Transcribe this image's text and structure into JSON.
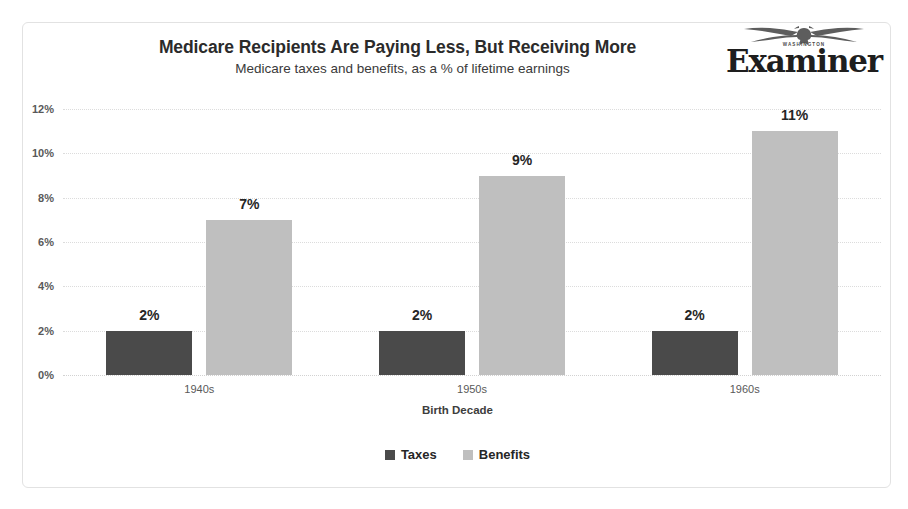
{
  "frame": {
    "border_color": "#e2e2e2",
    "background": "#ffffff"
  },
  "logo": {
    "kicker": "WASHINGTON",
    "wordmark": "Examiner",
    "eagle_icon": "eagle-icon"
  },
  "chart_data": {
    "type": "bar",
    "title": "Medicare Recipients Are Paying Less, But Receiving More",
    "subtitle": "Medicare taxes and benefits, as a % of lifetime earnings",
    "xlabel": "Birth Decade",
    "ylabel": "",
    "categories": [
      "1940s",
      "1950s",
      "1960s"
    ],
    "series": [
      {
        "name": "Taxes",
        "color": "#4a4a4a",
        "values": [
          2,
          2,
          2
        ],
        "labels": [
          "2%",
          "2%",
          "2%"
        ]
      },
      {
        "name": "Benefits",
        "color": "#bfbfbf",
        "values": [
          7,
          9,
          11
        ],
        "labels": [
          "7%",
          "9%",
          "11%"
        ]
      }
    ],
    "ylim": [
      0,
      12
    ],
    "ytick_values": [
      12,
      10,
      8,
      6,
      4,
      2,
      0
    ],
    "ytick_labels": [
      "12%",
      "10%",
      "8%",
      "6%",
      "4%",
      "2%",
      "0%"
    ],
    "grid": true,
    "grid_axis": "y",
    "grid_style": "dotted",
    "legend_position": "bottom",
    "value_labels": true,
    "units": "percent"
  }
}
